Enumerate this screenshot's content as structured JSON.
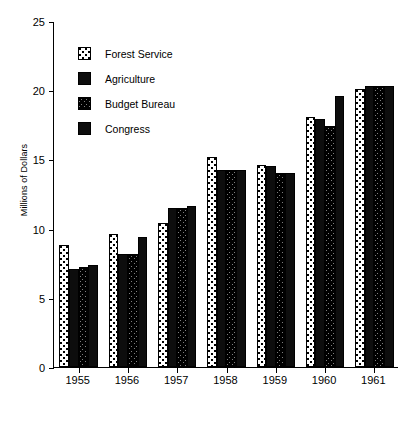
{
  "chart_data": {
    "type": "bar",
    "title": "",
    "xlabel": "",
    "ylabel": "Millions of Dollars",
    "ylim": [
      0,
      25
    ],
    "yticks": [
      0,
      5,
      10,
      15,
      20,
      25
    ],
    "grid": false,
    "legend_position": "upper-left-inside",
    "categories": [
      "1955",
      "1956",
      "1957",
      "1958",
      "1959",
      "1960",
      "1961"
    ],
    "series": [
      {
        "name": "Forest Service",
        "pattern": "dots",
        "values": [
          8.8,
          9.6,
          10.4,
          15.2,
          14.6,
          18.1,
          20.1
        ]
      },
      {
        "name": "Agriculture",
        "pattern": "solid",
        "values": [
          7.1,
          8.2,
          11.5,
          14.2,
          14.5,
          17.9,
          20.3
        ]
      },
      {
        "name": "Budget Bureau",
        "pattern": "wave",
        "values": [
          7.2,
          8.2,
          11.5,
          14.2,
          14.0,
          17.4,
          20.3
        ]
      },
      {
        "name": "Congress",
        "pattern": "solid",
        "values": [
          7.4,
          9.4,
          11.6,
          14.2,
          14.0,
          19.6,
          20.3
        ]
      }
    ]
  },
  "axis": {
    "y_title": "Millions of Dollars",
    "y_tick_labels": [
      "0",
      "5",
      "10",
      "15",
      "20",
      "25"
    ],
    "x_tick_labels": [
      "1955",
      "1956",
      "1957",
      "1958",
      "1959",
      "1960",
      "1961"
    ]
  },
  "legend": {
    "items": [
      {
        "label": "Forest Service",
        "pattern": "dots"
      },
      {
        "label": "Agriculture",
        "pattern": "solid"
      },
      {
        "label": "Budget Bureau",
        "pattern": "wave"
      },
      {
        "label": "Congress",
        "pattern": "solid"
      }
    ]
  },
  "colors": {
    "ink": "#000000",
    "background": "#ffffff",
    "bar_solid": "#0d0d0d"
  }
}
